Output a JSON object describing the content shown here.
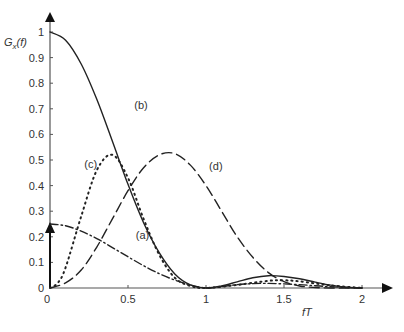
{
  "chart_data": {
    "type": "line",
    "title": "",
    "xlabel": "fT",
    "ylabel": "G_x(f)",
    "ylabel_main": "G",
    "ylabel_sub": "x",
    "ylabel_tail": "(f)",
    "xlim": [
      0,
      2
    ],
    "ylim": [
      0,
      1
    ],
    "grid": false,
    "legend": "inline labels",
    "x_ticks": [
      "0",
      "0.5",
      "1",
      "1.5",
      "2"
    ],
    "y_ticks": [
      "0",
      "0.1",
      "0.2",
      "0.3",
      "0.4",
      "0.5",
      "0.6",
      "0.7",
      "0.8",
      "0.9",
      "1"
    ],
    "annotations": [
      {
        "label": "(a)",
        "x": 0.55,
        "y": 0.19
      },
      {
        "label": "(b)",
        "x": 0.54,
        "y": 0.7
      },
      {
        "label": "(c)",
        "x": 0.22,
        "y": 0.47
      },
      {
        "label": "(d)",
        "x": 1.02,
        "y": 0.46
      }
    ],
    "impulse": {
      "x": 0,
      "height": 0.25,
      "note": "delta at f=0 with arrowhead"
    },
    "series": [
      {
        "name": "(a)",
        "style": "dash-dot",
        "x": [
          0,
          0.1,
          0.2,
          0.3,
          0.4,
          0.5,
          0.6,
          0.7,
          0.8,
          0.9,
          1.0,
          1.1,
          1.2,
          1.3,
          1.4,
          1.5,
          1.6,
          1.7,
          1.8,
          1.9,
          2.0
        ],
        "values": [
          0.25,
          0.243,
          0.222,
          0.193,
          0.158,
          0.122,
          0.087,
          0.056,
          0.031,
          0.012,
          0.0,
          0.006,
          0.013,
          0.017,
          0.018,
          0.016,
          0.013,
          0.009,
          0.005,
          0.002,
          0.0
        ]
      },
      {
        "name": "(b)",
        "style": "solid",
        "x": [
          0,
          0.1,
          0.2,
          0.3,
          0.4,
          0.5,
          0.6,
          0.7,
          0.8,
          0.9,
          1.0,
          1.1,
          1.2,
          1.3,
          1.4,
          1.5,
          1.6,
          1.7,
          1.8,
          1.9,
          2.0
        ],
        "values": [
          1.0,
          0.968,
          0.875,
          0.737,
          0.573,
          0.405,
          0.255,
          0.138,
          0.055,
          0.012,
          0.0,
          0.008,
          0.024,
          0.04,
          0.048,
          0.045,
          0.036,
          0.023,
          0.011,
          0.003,
          0.0
        ]
      },
      {
        "name": "(c)",
        "style": "dotted",
        "x": [
          0,
          0.05,
          0.1,
          0.2,
          0.3,
          0.4,
          0.5,
          0.6,
          0.7,
          0.8,
          0.9,
          1.0,
          1.2,
          1.4,
          1.5,
          1.6,
          1.8,
          2.0
        ],
        "values": [
          0.0,
          0.02,
          0.08,
          0.28,
          0.46,
          0.52,
          0.43,
          0.27,
          0.13,
          0.04,
          0.008,
          0.0,
          0.012,
          0.028,
          0.03,
          0.026,
          0.01,
          0.0
        ]
      },
      {
        "name": "(d)",
        "style": "dashed",
        "x": [
          0,
          0.1,
          0.2,
          0.3,
          0.4,
          0.5,
          0.6,
          0.7,
          0.8,
          0.9,
          1.0,
          1.1,
          1.2,
          1.3,
          1.4,
          1.5,
          1.6,
          1.7,
          1.8,
          1.9,
          2.0
        ],
        "values": [
          0.0,
          0.02,
          0.07,
          0.16,
          0.27,
          0.38,
          0.47,
          0.52,
          0.525,
          0.48,
          0.4,
          0.3,
          0.2,
          0.12,
          0.06,
          0.025,
          0.008,
          0.002,
          0.0,
          0.0,
          0.0
        ]
      }
    ]
  }
}
